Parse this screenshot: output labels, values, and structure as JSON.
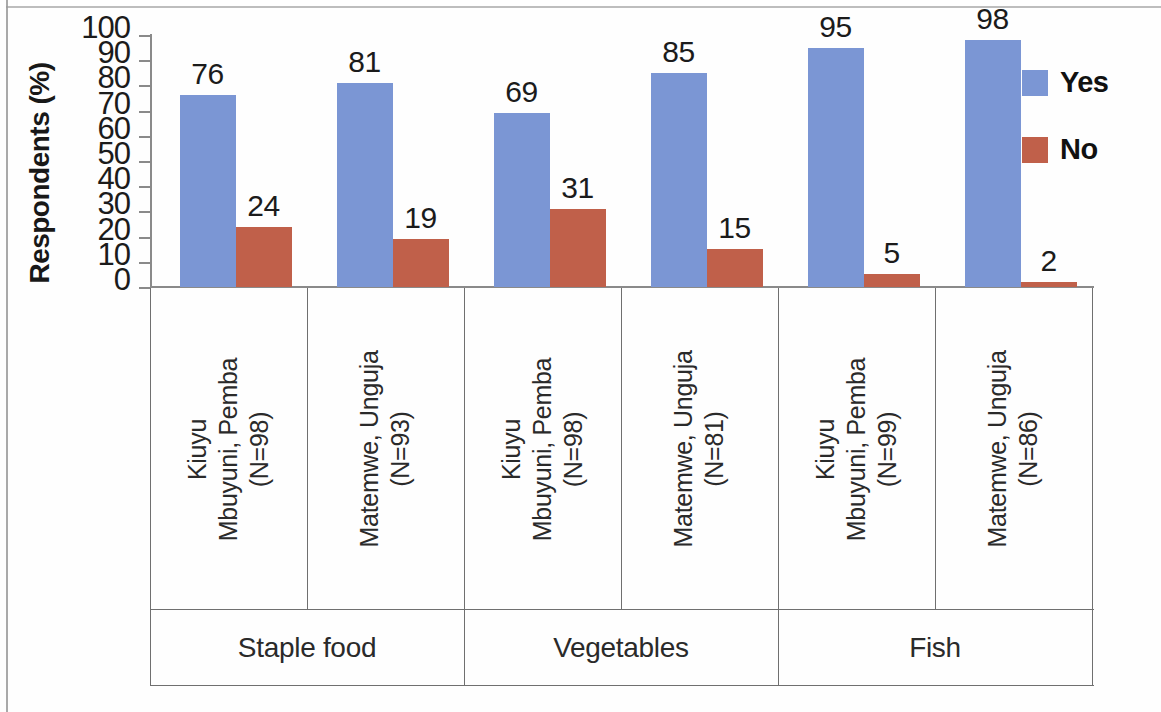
{
  "chart_data": {
    "type": "bar",
    "title": "",
    "xlabel": "",
    "ylabel": "Respondents (%)",
    "ylim": [
      0,
      100
    ],
    "ytick_labels": [
      "100",
      "90",
      "80",
      "70",
      "60",
      "50",
      "40",
      "30",
      "20",
      "10",
      "0"
    ],
    "grid": false,
    "legend_position": "right",
    "legend": [
      "Yes",
      "No"
    ],
    "group_labels": [
      "Staple food",
      "Vegetables",
      "Fish"
    ],
    "categories": [
      "Kiuyu Mbuyuni, Pemba (N=98)",
      "Matemwe, Unguja (N=93)",
      "Kiuyu Mbuyuni, Pemba (N=98)",
      "Matemwe, Unguja (N=81)",
      "Kiuyu Mbuyuni, Pemba (N=99)",
      "Matemwe, Unguja (N=86)"
    ],
    "category_lines": [
      [
        "Kiuyu",
        "Mbuyuni, Pemba",
        "(N=98)"
      ],
      [
        "Matemwe, Unguja",
        "(N=93)"
      ],
      [
        "Kiuyu",
        "Mbuyuni, Pemba",
        "(N=98)"
      ],
      [
        "Matemwe, Unguja",
        "(N=81)"
      ],
      [
        "Kiuyu",
        "Mbuyuni, Pemba",
        "(N=99)"
      ],
      [
        "Matemwe, Unguja",
        "(N=86)"
      ]
    ],
    "series": [
      {
        "name": "Yes",
        "color": "#7b96d4",
        "values": [
          76,
          81,
          69,
          85,
          95,
          98
        ]
      },
      {
        "name": "No",
        "color": "#c0604a",
        "values": [
          24,
          19,
          31,
          15,
          5,
          2
        ]
      }
    ]
  },
  "axis": {
    "ytitle": "Respondents (%)"
  },
  "legend": {
    "yes_label": "Yes",
    "no_label": "No"
  },
  "groups": [
    {
      "label": "Staple food"
    },
    {
      "label": "Vegetables"
    },
    {
      "label": "Fish"
    }
  ],
  "bars": [
    {
      "yes": "76",
      "no": "24"
    },
    {
      "yes": "81",
      "no": "19"
    },
    {
      "yes": "69",
      "no": "31"
    },
    {
      "yes": "85",
      "no": "15"
    },
    {
      "yes": "95",
      "no": "5"
    },
    {
      "yes": "98",
      "no": "2"
    }
  ],
  "colors": {
    "yes": "#7b96d4",
    "no": "#c0604a",
    "axis": "#8a8a8a",
    "text": "#1b1b1b"
  }
}
